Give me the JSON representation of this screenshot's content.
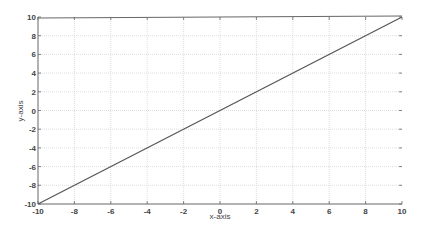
{
  "chart_data": {
    "type": "line",
    "title": "",
    "xlabel": "x-axis",
    "ylabel": "y-axis",
    "xlim": [
      -10,
      10
    ],
    "ylim": [
      -10,
      10
    ],
    "xticks": [
      -10,
      -8,
      -6,
      -4,
      -2,
      0,
      2,
      4,
      6,
      8,
      10
    ],
    "yticks": [
      -10,
      -8,
      -6,
      -4,
      -2,
      0,
      2,
      4,
      6,
      8,
      10
    ],
    "grid": true,
    "legend": null,
    "series": [
      {
        "name": "y = x",
        "x": [
          -10,
          10
        ],
        "y": [
          -10,
          10
        ],
        "color": "#555555"
      }
    ]
  },
  "style": {
    "axis_color": "#666666",
    "grid_color": "#d0d0d0",
    "text_color": "#444444"
  }
}
